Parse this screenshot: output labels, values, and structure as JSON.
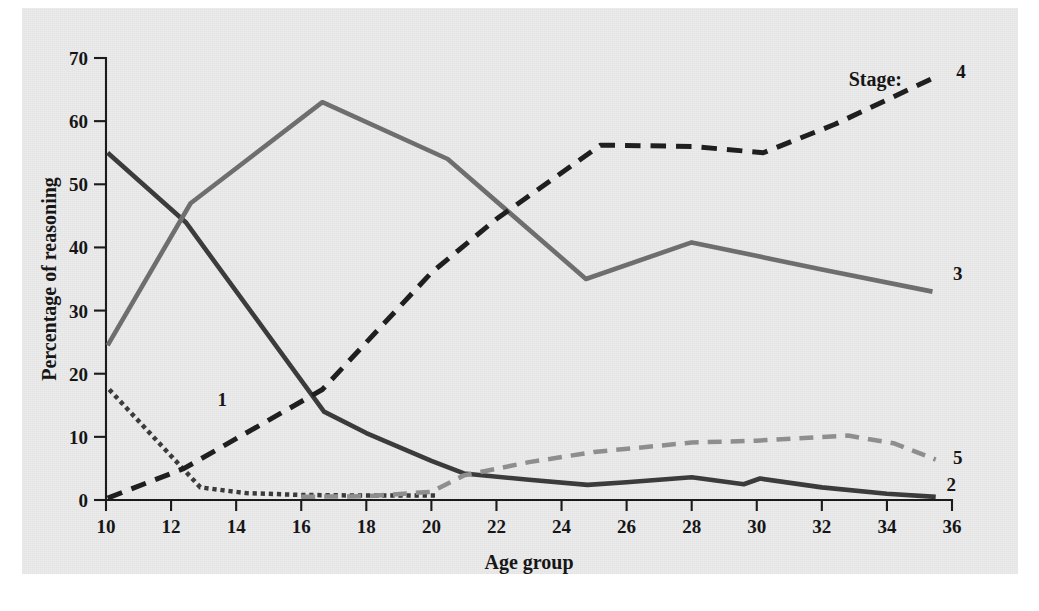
{
  "figure": {
    "background_color": "#ececed",
    "page_color": "#ffffff"
  },
  "legend": {
    "title": "Stage:",
    "entries": [
      {
        "label": "1",
        "style": "dotted",
        "color": "#3b3b3b"
      },
      {
        "label": "2",
        "style": "solid",
        "color": "#3b3b3b"
      },
      {
        "label": "3",
        "style": "solid",
        "color": "#6e6e6e"
      },
      {
        "label": "4",
        "style": "dashed",
        "color": "#1f1f1f"
      },
      {
        "label": "5",
        "style": "dashed",
        "color": "#8e8e8e"
      }
    ]
  },
  "chart_data": {
    "type": "line",
    "title": "",
    "xlabel": "Age group",
    "ylabel": "Percentage of reasoning",
    "xlim": [
      10,
      36
    ],
    "ylim": [
      0,
      70
    ],
    "xticks": [
      10,
      12,
      14,
      16,
      18,
      20,
      22,
      24,
      26,
      28,
      30,
      32,
      34,
      36
    ],
    "yticks": [
      0,
      10,
      20,
      30,
      40,
      50,
      60,
      70
    ],
    "xtick_labels": [
      "10",
      "12",
      "14",
      "16",
      "18",
      "20",
      "22",
      "24",
      "26",
      "28",
      "30",
      "32",
      "34",
      "36"
    ],
    "ytick_labels": [
      "0",
      "10",
      "20",
      "30",
      "40",
      "50",
      "60",
      "70"
    ],
    "grid": false,
    "legend_position": "right-inline",
    "series": [
      {
        "name": "Stage 1",
        "label": "1",
        "color": "#3b3b3b",
        "style": "dotted",
        "width": 4.5,
        "label_x": 13.0,
        "label_y": 16.0,
        "points": [
          [
            10.1,
            17.5
          ],
          [
            12.9,
            2.0
          ],
          [
            14.3,
            1.1
          ],
          [
            16.0,
            0.8
          ],
          [
            18.0,
            0.7
          ],
          [
            20.2,
            0.7
          ]
        ]
      },
      {
        "name": "Stage 2",
        "label": "2",
        "color": "#3b3b3b",
        "style": "solid",
        "width": 4.6,
        "label_x": 35.4,
        "label_y": 2.6,
        "points": [
          [
            10.05,
            55.0
          ],
          [
            12.45,
            44.0
          ],
          [
            16.7,
            14.0
          ],
          [
            18.0,
            10.6
          ],
          [
            20.0,
            6.2
          ],
          [
            21.0,
            4.2
          ],
          [
            23.0,
            3.2
          ],
          [
            24.8,
            2.4
          ],
          [
            26.0,
            2.8
          ],
          [
            28.0,
            3.6
          ],
          [
            29.6,
            2.5
          ],
          [
            30.1,
            3.4
          ],
          [
            32.0,
            2.0
          ],
          [
            34.0,
            1.0
          ],
          [
            35.5,
            0.5
          ]
        ]
      },
      {
        "name": "Stage 3",
        "label": "3",
        "color": "#6e6e6e",
        "style": "solid",
        "width": 4.6,
        "label_x": 35.6,
        "label_y": 36.0,
        "points": [
          [
            10.05,
            24.5
          ],
          [
            12.6,
            47.0
          ],
          [
            16.65,
            63.0
          ],
          [
            20.5,
            54.0
          ],
          [
            24.75,
            35.0
          ],
          [
            28.0,
            40.8
          ],
          [
            32.0,
            36.5
          ],
          [
            35.4,
            33.0
          ]
        ]
      },
      {
        "name": "Stage 4",
        "label": "4",
        "color": "#1f1f1f",
        "style": "dashed",
        "width": 5.0,
        "label_x": 35.7,
        "label_y": 68.0,
        "points": [
          [
            10.05,
            0.3
          ],
          [
            12.4,
            5.0
          ],
          [
            16.65,
            17.5
          ],
          [
            20.0,
            36.0
          ],
          [
            22.0,
            44.5
          ],
          [
            25.2,
            56.2
          ],
          [
            28.0,
            56.0
          ],
          [
            30.2,
            55.0
          ],
          [
            32.4,
            59.5
          ],
          [
            35.5,
            67.0
          ]
        ]
      },
      {
        "name": "Stage 5",
        "label": "5",
        "color": "#8e8e8e",
        "style": "dashed",
        "width": 4.5,
        "label_x": 35.6,
        "label_y": 6.8,
        "points": [
          [
            16.0,
            0.5
          ],
          [
            18.0,
            0.6
          ],
          [
            20.0,
            1.3
          ],
          [
            21.0,
            3.9
          ],
          [
            23.0,
            6.0
          ],
          [
            25.0,
            7.6
          ],
          [
            28.0,
            9.1
          ],
          [
            30.0,
            9.4
          ],
          [
            32.8,
            10.2
          ],
          [
            34.2,
            9.0
          ],
          [
            35.5,
            6.4
          ]
        ]
      }
    ]
  }
}
